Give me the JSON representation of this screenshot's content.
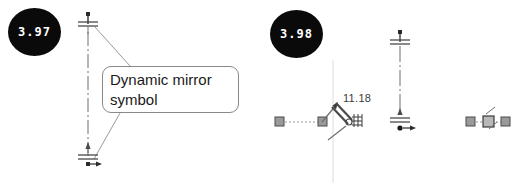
{
  "figure": {
    "background_color": "#ffffff",
    "line_color": "#808080",
    "dark_color": "#2b2b2b",
    "badge_color": "#0a0a0a",
    "badge_text_color": "#ffffff"
  },
  "panels": [
    {
      "id": "panel-left",
      "badge": {
        "label": "3.97",
        "name": "step-badge-397"
      },
      "callout": {
        "text": "Dynamic mirror\nsymbol",
        "name": "dynamic-mirror-callout"
      },
      "centerline": {
        "name": "vertical-centerline",
        "top_symbol": "mirror-symbol-top",
        "bottom_symbol": "mirror-symbol-bottom"
      },
      "leaders": [
        {
          "name": "leader-line-top"
        },
        {
          "name": "leader-line-bottom"
        }
      ]
    },
    {
      "id": "panel-right",
      "badge": {
        "label": "3.98",
        "name": "step-badge-398"
      },
      "dimension": {
        "value": "11.18",
        "name": "dimension-label-1118"
      },
      "sketch_entities": [
        {
          "name": "sketch-line-left",
          "handles": 2
        },
        {
          "name": "mirror-cursor-glyph"
        },
        {
          "name": "grid-cursor-icon"
        },
        {
          "name": "vertical-centerline-right"
        },
        {
          "name": "sketch-line-right",
          "handles": 3
        }
      ]
    }
  ]
}
